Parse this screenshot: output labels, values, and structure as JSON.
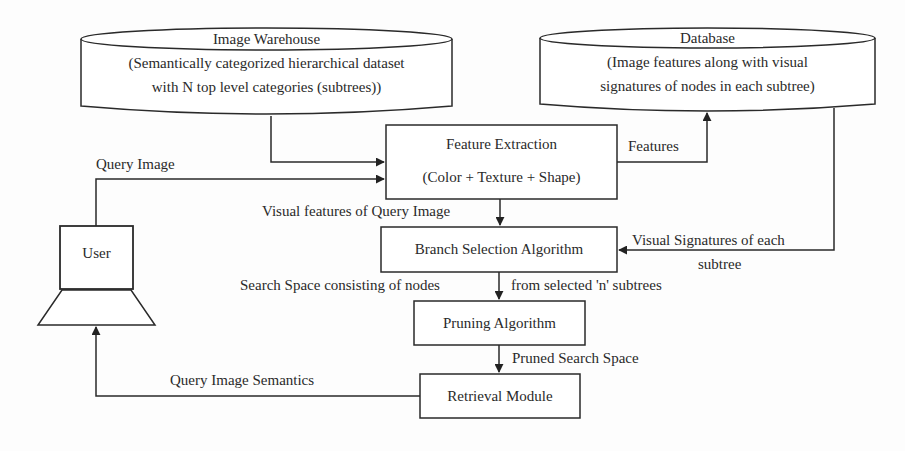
{
  "nodes": {
    "image_warehouse": {
      "title": "Image Warehouse",
      "line1": "(Semantically categorized hierarchical dataset",
      "line2": "with N top level categories (subtrees))"
    },
    "database": {
      "title": "Database",
      "line1": "(Image features along with visual",
      "line2": "signatures of nodes in each subtree)"
    },
    "feature_extraction": {
      "title": "Feature Extraction",
      "subtitle": "(Color + Texture + Shape)"
    },
    "branch_selection": {
      "title": "Branch Selection Algorithm"
    },
    "pruning": {
      "title": "Pruning Algorithm"
    },
    "retrieval": {
      "title": "Retrieval Module"
    },
    "user": {
      "title": "User"
    }
  },
  "edges": {
    "query_image": "Query Image",
    "features": "Features",
    "visual_features_query": "Visual features of Query Image",
    "visual_signatures_1": "Visual Signatures of each",
    "visual_signatures_2": "subtree",
    "search_space_left": "Search Space consisting of nodes",
    "search_space_right": "from selected 'n' subtrees",
    "pruned_search_space": "Pruned Search Space",
    "query_image_semantics": "Query Image Semantics"
  }
}
